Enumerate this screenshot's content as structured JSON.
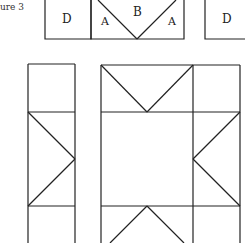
{
  "figure": {
    "caption": "ure 3",
    "top_row": {
      "left_label": "D",
      "center_label": "B",
      "triangle_left_label": "A",
      "triangle_right_label": "A",
      "right_label": "D"
    },
    "stroke_color": "#222222",
    "background": "#ffffff"
  }
}
